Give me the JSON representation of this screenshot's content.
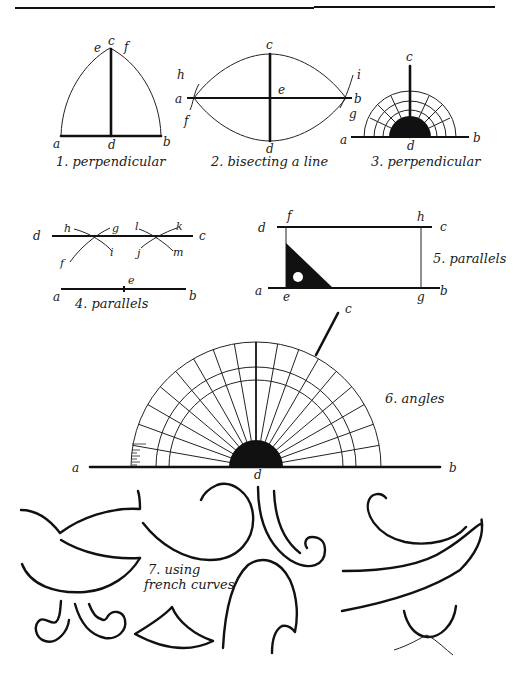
{
  "figures": {
    "fig1": {
      "caption": "1. perpendicular",
      "labels": {
        "a": "a",
        "b": "b",
        "c": "c",
        "d": "d",
        "e": "e",
        "f": "f"
      }
    },
    "fig2": {
      "caption": "2. bisecting a line",
      "labels": {
        "a": "a",
        "b": "b",
        "c": "c",
        "d": "d",
        "e": "e",
        "f": "f",
        "g": "g",
        "h": "h",
        "i": "i"
      }
    },
    "fig3": {
      "caption": "3. perpendicular",
      "labels": {
        "a": "a",
        "b": "b",
        "c": "c",
        "d": "d"
      }
    },
    "fig4": {
      "caption": "4. parallels",
      "labels": {
        "a": "a",
        "b": "b",
        "c": "c",
        "d": "d",
        "e": "e",
        "f": "f",
        "g": "g",
        "h": "h",
        "i": "i",
        "j": "j",
        "k": "k",
        "l": "l",
        "m": "m"
      }
    },
    "fig5": {
      "caption": "5. parallels",
      "labels": {
        "a": "a",
        "b": "b",
        "c": "c",
        "d": "d",
        "e": "e",
        "f": "f",
        "g": "g",
        "h": "h"
      }
    },
    "fig6": {
      "caption": "6. angles",
      "labels": {
        "a": "a",
        "b": "b",
        "c": "c",
        "d": "d"
      }
    },
    "fig7": {
      "caption_line1": "7. using",
      "caption_line2": "french curves"
    }
  },
  "colors": {
    "ink": "#111111",
    "paper": "#ffffff"
  }
}
